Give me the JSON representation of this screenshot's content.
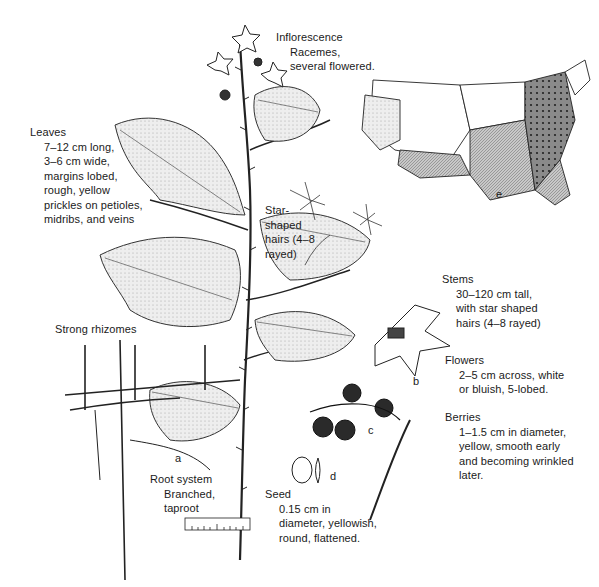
{
  "figure": {
    "panels": [
      "a",
      "b",
      "c",
      "d",
      "e"
    ]
  },
  "labels": {
    "inflorescence": {
      "head": "Inflorescence",
      "lines": [
        "Racemes,",
        "several flowered."
      ]
    },
    "leaves": {
      "head": "Leaves",
      "lines": [
        "7–12 cm long,",
        "3–6 cm wide,",
        "margins lobed,",
        "rough, yellow",
        "prickles on petioles,",
        "midribs, and veins"
      ]
    },
    "star_hairs": {
      "lines": [
        "Star-",
        "shaped",
        "hairs (4–8",
        "rayed)"
      ]
    },
    "stems": {
      "head": "Stems",
      "lines": [
        "30–120 cm tall,",
        "with star shaped",
        "hairs (4–8 rayed)"
      ]
    },
    "rhizomes": {
      "head": "Strong rhizomes"
    },
    "flowers": {
      "head": "Flowers",
      "lines": [
        "2–5 cm across, white",
        "or bluish, 5-lobed."
      ]
    },
    "berries": {
      "head": "Berries",
      "lines": [
        "1–1.5 cm in diameter,",
        "yellow, smooth early",
        "and becoming wrinkled",
        "later."
      ]
    },
    "root_system": {
      "head": "Root system",
      "lines": [
        "Branched,",
        "taproot"
      ]
    },
    "seed": {
      "head": "Seed",
      "lines": [
        "0.15 cm in",
        "diameter, yellowish,",
        "round, flattened."
      ]
    }
  },
  "panel_letters": {
    "a": "a",
    "b": "b",
    "c": "c",
    "d": "d",
    "e": "e"
  },
  "scale_ruler": {
    "ticks": [
      "1",
      "2",
      "3",
      "4",
      "5"
    ]
  },
  "map": {
    "title": "e",
    "legend_shades": {
      "none": "#ffffff",
      "light": "#d9d9d9",
      "medium": "#a8a8a8",
      "dense": "#6f6f6f"
    }
  }
}
